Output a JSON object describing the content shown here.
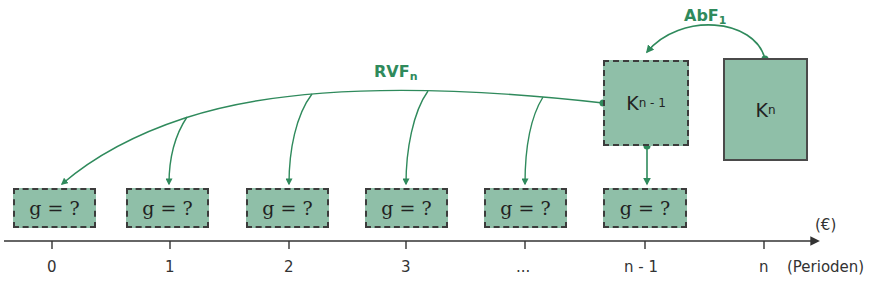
{
  "colors": {
    "arrow_green": "#2f8a5c",
    "box_fill": "#8fbfa8",
    "axis": "#333333"
  },
  "labels": {
    "abf": {
      "main": "AbF",
      "sub": "1"
    },
    "rvf": {
      "main": "RVF",
      "sub": "n"
    }
  },
  "capital_boxes": {
    "k_n_minus_1": {
      "main": "K",
      "sub": "n - 1"
    },
    "k_n": {
      "main": "K",
      "sub": "n"
    }
  },
  "g_boxes": [
    {
      "text": "g = ?"
    },
    {
      "text": "g = ?"
    },
    {
      "text": "g = ?"
    },
    {
      "text": "g = ?"
    },
    {
      "text": "g = ?"
    },
    {
      "text": "g = ?"
    }
  ],
  "axis": {
    "unit_label": "(€)",
    "period_label": "(Perioden)",
    "ticks": [
      "0",
      "1",
      "2",
      "3",
      "...",
      "n - 1",
      "n"
    ]
  }
}
